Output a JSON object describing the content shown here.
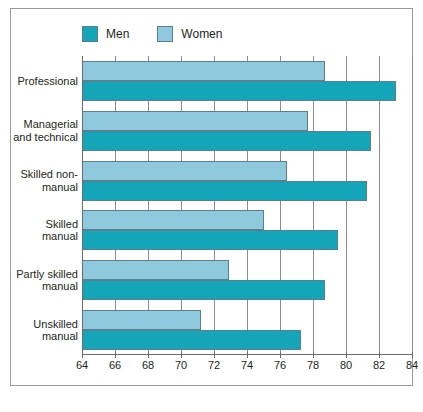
{
  "chart_data": {
    "type": "bar",
    "orientation": "horizontal",
    "title": "",
    "subtitle": "",
    "xlabel": "",
    "ylabel": "",
    "xlim": [
      64,
      84
    ],
    "xticks": [
      64,
      66,
      68,
      70,
      72,
      74,
      76,
      78,
      80,
      82,
      84
    ],
    "xtick_labels": [
      "64",
      "66",
      "68",
      "70",
      "72",
      "74",
      "76",
      "78",
      "80",
      "82",
      "84"
    ],
    "grid": true,
    "grid_axis": "x",
    "legend_position": "top-left",
    "categories": [
      "Professional",
      "Managerial and technical",
      "Skilled non-manual",
      "Skilled manual",
      "Partly skilled manual",
      "Unskilled manual"
    ],
    "category_label_lines": [
      [
        "Professional"
      ],
      [
        "Managerial",
        "and technical"
      ],
      [
        "Skilled non-",
        "manual"
      ],
      [
        "Skilled",
        "manual"
      ],
      [
        "Partly skilled",
        "manual"
      ],
      [
        "Unskilled",
        "manual"
      ]
    ],
    "series": [
      {
        "name": "Men",
        "color": "#14a5b8",
        "values": [
          83.0,
          81.5,
          81.3,
          79.5,
          78.7,
          77.3
        ]
      },
      {
        "name": "Women",
        "color": "#8ec9dd",
        "values": [
          78.7,
          77.7,
          76.4,
          75.0,
          72.9,
          71.2
        ]
      }
    ]
  },
  "legend": {
    "entries": [
      {
        "label": "Men",
        "swatch": "men"
      },
      {
        "label": "Women",
        "swatch": "women"
      }
    ]
  },
  "colors": {
    "men": "#14a5b8",
    "women": "#8ec9dd",
    "bar_outline": "#5b7f8c",
    "gridline": "#8c8c8c",
    "frame": "#9a9a9a",
    "text": "#231f20",
    "background": "#ffffff"
  },
  "caption": ""
}
